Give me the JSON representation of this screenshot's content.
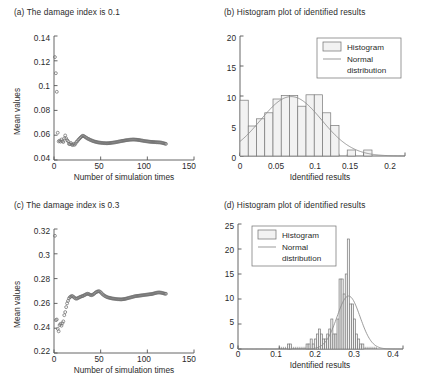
{
  "figure": {
    "panels": [
      {
        "key": "a",
        "title": "(a) The damage index is 0.1"
      },
      {
        "key": "b",
        "title": "(b) Histogram plot of identified results"
      },
      {
        "key": "c",
        "title": "(c) The damage index is 0.3"
      },
      {
        "key": "d",
        "title": "(d) Histogram plot of identified results"
      }
    ]
  },
  "legend": {
    "histogram_label": "Histogram",
    "normal_label_line1": "Normal",
    "normal_label_line2": "distribution"
  },
  "colors": {
    "axis": "#555555",
    "marker": "#6f6f6f",
    "bar_fill": "#f2f2f2",
    "bar_stroke": "#777777",
    "curve": "#8a8a8a",
    "text": "#2b2b2b"
  },
  "chart_data": [
    {
      "panel": "a",
      "type": "scatter",
      "title": "(a) The damage index is 0.1",
      "xlabel": "Number of simulation times",
      "ylabel": "Mean values",
      "xlim": [
        0,
        150
      ],
      "ylim": [
        0.04,
        0.14
      ],
      "xticks": [
        0,
        50,
        100,
        150
      ],
      "yticks": [
        "0.04",
        "0.06",
        "0.08",
        "0.1",
        "0.12",
        "0.14"
      ],
      "grid": false,
      "legend": "none",
      "marker": "open-circle",
      "x": [
        1,
        2,
        3,
        4,
        5,
        6,
        7,
        8,
        9,
        10,
        11,
        12,
        13,
        14,
        15,
        16,
        17,
        18,
        19,
        20,
        21,
        22,
        23,
        24,
        25,
        26,
        27,
        28,
        29,
        30,
        31,
        32,
        33,
        34,
        35,
        36,
        37,
        38,
        39,
        40,
        41,
        42,
        43,
        44,
        45,
        46,
        47,
        48,
        49,
        50,
        51,
        52,
        53,
        54,
        55,
        56,
        57,
        58,
        59,
        60,
        61,
        62,
        63,
        64,
        65,
        66,
        67,
        68,
        69,
        70,
        71,
        72,
        73,
        74,
        75,
        76,
        77,
        78,
        79,
        80,
        81,
        82,
        83,
        84,
        85,
        86,
        87,
        88,
        89,
        90,
        91,
        92,
        93,
        94,
        95,
        96,
        97,
        98,
        99,
        100,
        101,
        102,
        103,
        104,
        105,
        106,
        107,
        108,
        109,
        110,
        111,
        112,
        113,
        114,
        115,
        116,
        117,
        118,
        119,
        120
      ],
      "y": [
        0.123,
        0.11,
        0.095,
        0.062,
        0.055,
        0.0555,
        0.0548,
        0.0565,
        0.0552,
        0.0545,
        0.0575,
        0.0598,
        0.0575,
        0.056,
        0.0552,
        0.053,
        0.0528,
        0.0538,
        0.0525,
        0.052,
        0.053,
        0.0522,
        0.0532,
        0.0545,
        0.0552,
        0.0562,
        0.057,
        0.0578,
        0.0585,
        0.0592,
        0.0596,
        0.0592,
        0.0588,
        0.0582,
        0.0578,
        0.0572,
        0.057,
        0.0565,
        0.0562,
        0.0558,
        0.0556,
        0.0552,
        0.055,
        0.0548,
        0.0546,
        0.0544,
        0.0542,
        0.0541,
        0.054,
        0.0539,
        0.0538,
        0.0537,
        0.0537,
        0.0536,
        0.0536,
        0.0535,
        0.0535,
        0.0536,
        0.0536,
        0.0537,
        0.0538,
        0.0539,
        0.054,
        0.0541,
        0.0542,
        0.0543,
        0.0545,
        0.0546,
        0.0548,
        0.0549,
        0.0551,
        0.0552,
        0.0554,
        0.0555,
        0.0556,
        0.0558,
        0.0559,
        0.056,
        0.0561,
        0.0562,
        0.0563,
        0.0564,
        0.0564,
        0.0565,
        0.0565,
        0.0565,
        0.0564,
        0.0564,
        0.0563,
        0.0562,
        0.0561,
        0.056,
        0.0558,
        0.0557,
        0.0556,
        0.0554,
        0.0553,
        0.0552,
        0.0551,
        0.055,
        0.0549,
        0.0548,
        0.0547,
        0.0546,
        0.0546,
        0.0545,
        0.0545,
        0.0544,
        0.0544,
        0.0543,
        0.0543,
        0.0542,
        0.0542,
        0.0541,
        0.054,
        0.0538,
        0.0536,
        0.0534,
        0.0532,
        0.053
      ]
    },
    {
      "panel": "b",
      "type": "bar",
      "title": "(b) Histogram plot of identified results",
      "xlabel": "Identified results",
      "ylabel": "",
      "xlim": [
        0,
        0.2
      ],
      "ylim": [
        0,
        20
      ],
      "xticks": [
        0,
        0.05,
        0.1,
        0.15,
        0.2
      ],
      "yticks": [
        0,
        5,
        10,
        15,
        20
      ],
      "grid": false,
      "legend": "top-right",
      "bin_width": 0.01,
      "bin_starts": [
        0.0,
        0.01,
        0.02,
        0.03,
        0.04,
        0.05,
        0.06,
        0.07,
        0.08,
        0.09,
        0.1,
        0.11,
        0.12,
        0.13,
        0.14,
        0.15
      ],
      "values": [
        9.3,
        5.0,
        6.2,
        7.2,
        9.5,
        10.1,
        10.1,
        8.3,
        10.2,
        10.2,
        7.2,
        5.1,
        0,
        1.0,
        0,
        1.0
      ],
      "normal_curve": {
        "mean": 0.062,
        "std": 0.037,
        "peak": 9.9
      }
    },
    {
      "panel": "c",
      "type": "scatter",
      "title": "(c) The damage index is 0.3",
      "xlabel": "Number of simulation times",
      "ylabel": "Mean values",
      "xlim": [
        0,
        150
      ],
      "ylim": [
        0.22,
        0.32
      ],
      "xticks": [
        0,
        50,
        100,
        150
      ],
      "yticks": [
        "0.22",
        "0.24",
        "0.26",
        "0.28",
        "0.3",
        "0.32"
      ],
      "grid": false,
      "legend": "none",
      "marker": "open-circle",
      "x": [
        1,
        2,
        3,
        4,
        5,
        6,
        7,
        8,
        9,
        10,
        11,
        12,
        13,
        14,
        15,
        16,
        17,
        18,
        19,
        20,
        21,
        22,
        23,
        24,
        25,
        26,
        27,
        28,
        29,
        30,
        31,
        32,
        33,
        34,
        35,
        36,
        37,
        38,
        39,
        40,
        41,
        42,
        43,
        44,
        45,
        46,
        47,
        48,
        49,
        50,
        51,
        52,
        53,
        54,
        55,
        56,
        57,
        58,
        59,
        60,
        61,
        62,
        63,
        64,
        65,
        66,
        67,
        68,
        69,
        70,
        71,
        72,
        73,
        74,
        75,
        76,
        77,
        78,
        79,
        80,
        81,
        82,
        83,
        84,
        85,
        86,
        87,
        88,
        89,
        90,
        91,
        92,
        93,
        94,
        95,
        96,
        97,
        98,
        99,
        100,
        101,
        102,
        103,
        104,
        105,
        106,
        107,
        108,
        109,
        110,
        111,
        112,
        113,
        114,
        115,
        116,
        117,
        118,
        119,
        120
      ],
      "y": [
        0.3145,
        0.2465,
        0.247,
        0.2395,
        0.2375,
        0.2425,
        0.2435,
        0.242,
        0.244,
        0.2455,
        0.2505,
        0.253,
        0.257,
        0.26,
        0.262,
        0.264,
        0.265,
        0.2655,
        0.266,
        0.2658,
        0.2652,
        0.2645,
        0.264,
        0.2638,
        0.264,
        0.2645,
        0.2648,
        0.2652,
        0.2655,
        0.2658,
        0.266,
        0.2664,
        0.2668,
        0.2672,
        0.2676,
        0.2678,
        0.2676,
        0.2672,
        0.2668,
        0.2666,
        0.2668,
        0.2672,
        0.2678,
        0.2684,
        0.269,
        0.2694,
        0.2697,
        0.2698,
        0.2696,
        0.269,
        0.2682,
        0.2674,
        0.2668,
        0.2662,
        0.2658,
        0.2654,
        0.265,
        0.2648,
        0.2646,
        0.2644,
        0.2642,
        0.264,
        0.2639,
        0.2638,
        0.2637,
        0.2636,
        0.2635,
        0.2634,
        0.2634,
        0.2633,
        0.2633,
        0.2632,
        0.2633,
        0.2634,
        0.2635,
        0.2636,
        0.2638,
        0.264,
        0.2642,
        0.2644,
        0.2646,
        0.2648,
        0.265,
        0.2652,
        0.2654,
        0.2656,
        0.2658,
        0.2659,
        0.266,
        0.2661,
        0.2662,
        0.2663,
        0.2664,
        0.2665,
        0.2666,
        0.2667,
        0.2668,
        0.2669,
        0.267,
        0.2671,
        0.2672,
        0.2673,
        0.2674,
        0.2675,
        0.2676,
        0.2678,
        0.268,
        0.2682,
        0.2684,
        0.2686,
        0.2687,
        0.2688,
        0.2688,
        0.2687,
        0.2686,
        0.2684,
        0.2682,
        0.268,
        0.2678,
        0.2678
      ]
    },
    {
      "panel": "d",
      "type": "bar",
      "title": "(d) Histogram plot of identified results",
      "xlabel": "Identified results",
      "ylabel": "",
      "xlim": [
        0,
        0.4
      ],
      "ylim": [
        0,
        25
      ],
      "xticks": [
        0,
        0.1,
        0.2,
        0.3,
        0.4
      ],
      "yticks": [
        0,
        5,
        10,
        15,
        20,
        25
      ],
      "grid": false,
      "legend": "top-left",
      "bin_width": 0.005,
      "bin_starts": [
        0.1,
        0.105,
        0.11,
        0.115,
        0.12,
        0.125,
        0.13,
        0.135,
        0.14,
        0.145,
        0.15,
        0.155,
        0.16,
        0.165,
        0.17,
        0.175,
        0.18,
        0.185,
        0.19,
        0.195,
        0.2,
        0.205,
        0.21,
        0.215,
        0.22,
        0.225,
        0.23,
        0.235,
        0.24,
        0.245,
        0.25,
        0.255,
        0.26,
        0.265,
        0.27,
        0.275,
        0.28,
        0.285,
        0.29,
        0.295,
        0.3,
        0.305,
        0.31,
        0.315,
        0.32,
        0.325,
        0.33,
        0.335
      ],
      "values": [
        0,
        0,
        0,
        0,
        1,
        1,
        0,
        0,
        0,
        0,
        0,
        0,
        0,
        1,
        1,
        2,
        1,
        2,
        3,
        4,
        3,
        2,
        2,
        3,
        4,
        6,
        3,
        3,
        6,
        14,
        14,
        11,
        15,
        22,
        9,
        9,
        6,
        3,
        2,
        1,
        1,
        0,
        0,
        0,
        0,
        0,
        0,
        0
      ],
      "normal_curve": {
        "mean": 0.268,
        "std": 0.028,
        "peak": 10.6
      }
    }
  ]
}
